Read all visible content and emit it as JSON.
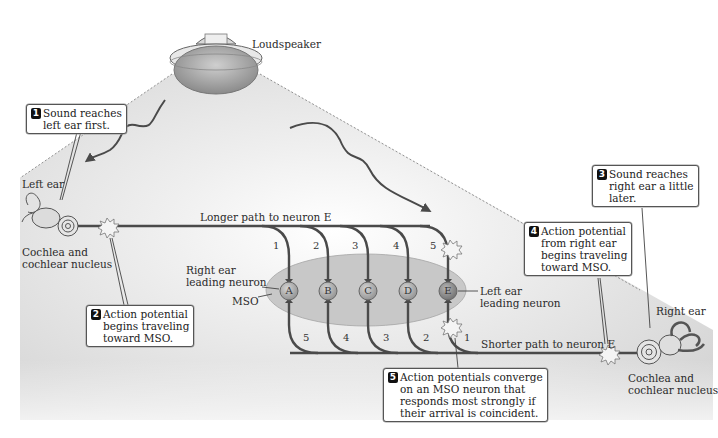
{
  "labels": {
    "loudspeaker": "Loudspeaker",
    "left_ear": "Left ear",
    "right_ear": "Right ear",
    "left_cochlea": "Cochlea and\ncochlear nucleus",
    "right_cochlea": "Cochlea and\ncochlear nucleus",
    "longer_path": "Longer path to neuron E",
    "shorter_path": "Shorter path to neuron E",
    "mso": "MSO",
    "right_leading": "Right ear\nleading neuron",
    "left_leading": "Left ear\nleading neuron"
  },
  "callouts": [
    {
      "step": "1",
      "text": "Sound reaches\nleft ear first."
    },
    {
      "step": "2",
      "text": "Action potential\nbegins traveling\ntoward MSO."
    },
    {
      "step": "3",
      "text": "Sound reaches\nright ear a little\nlater."
    },
    {
      "step": "4",
      "text": "Action potential\nfrom right ear\nbegins traveling\ntoward MSO."
    },
    {
      "step": "5",
      "text": "Action potentials converge\non an MSO neuron that\nresponds most strongly if\ntheir arrival is coincident."
    }
  ],
  "neurons": [
    "A",
    "B",
    "C",
    "D",
    "E"
  ],
  "top_path_numbers": [
    "1",
    "2",
    "3",
    "4",
    "5"
  ],
  "bottom_path_numbers": [
    "5",
    "4",
    "3",
    "2",
    "1"
  ],
  "colors": {
    "axon": "#4a4a4a",
    "mso_fill": "#c9c9c9",
    "neuron_fill": "#a9a9a9",
    "shading": "#d8d8d8",
    "step_badge": "#111111"
  }
}
